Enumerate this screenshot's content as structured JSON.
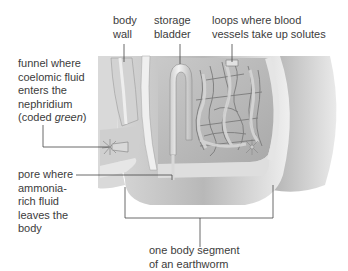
{
  "figure": {
    "colors": {
      "background": "#ffffff",
      "label_text": "#3c3c3c",
      "leader_line": "#444444",
      "tissue_light": "#e4e4e4",
      "tissue_mid": "#bdbdbd",
      "tissue_dark": "#8f8f8f"
    }
  },
  "labels": {
    "body_wall": {
      "lines": [
        "body",
        "wall"
      ]
    },
    "storage_bladder": {
      "lines": [
        "storage",
        "bladder"
      ]
    },
    "loops": {
      "lines": [
        "loops where blood",
        "vessels take up solutes"
      ]
    },
    "funnel": {
      "lines": [
        "funnel where",
        "coelomic fluid",
        "enters the",
        "nephridium"
      ],
      "last_line_prefix": "(coded ",
      "last_line_italic": "green",
      "last_line_suffix": ")"
    },
    "pore": {
      "lines": [
        "pore where",
        "ammonia-",
        "rich fluid",
        "leaves the",
        "body"
      ]
    },
    "segment": {
      "lines": [
        "one body segment",
        "of an earthworm"
      ]
    }
  }
}
